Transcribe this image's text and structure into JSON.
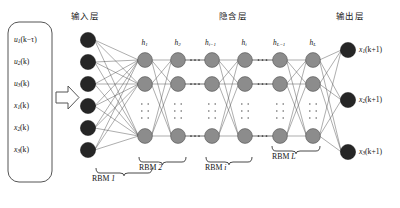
{
  "diagram": {
    "title_layers": {
      "input": "输入层",
      "hidden": "隐含层",
      "output": "输出层"
    },
    "input_box": {
      "labels": [
        {
          "base": "u",
          "sub": "1",
          "arg": "(k−τ)"
        },
        {
          "base": "u",
          "sub": "2",
          "arg": "(k)"
        },
        {
          "base": "u",
          "sub": "3",
          "arg": "(k)"
        },
        {
          "base": "x",
          "sub": "1",
          "arg": "(k)"
        },
        {
          "base": "x",
          "sub": "2",
          "arg": "(k)"
        },
        {
          "base": "x",
          "sub": "3",
          "arg": "(k)"
        }
      ]
    },
    "arrow": "flow-arrow-right",
    "input_nodes": {
      "count": 6,
      "color": "#262626"
    },
    "hidden_columns": [
      {
        "base": "h",
        "sub": "1"
      },
      {
        "base": "h",
        "sub": "2"
      },
      {
        "base": "h",
        "sub": "i−1"
      },
      {
        "base": "h",
        "sub": "i"
      },
      {
        "base": "h",
        "sub": "L−1"
      },
      {
        "base": "h",
        "sub": "L"
      }
    ],
    "hidden_nodes": {
      "rows_visible": 3,
      "color": "#8c8c8c",
      "vertical_ellipsis": true
    },
    "horizontal_ellipsis_between": [
      "h2-hi_minus_1",
      "hi-hL_minus_1"
    ],
    "output_nodes": {
      "count": 3,
      "color": "#262626"
    },
    "output_labels": [
      {
        "base": "x",
        "sub": "1",
        "arg": "(k+1)"
      },
      {
        "base": "x",
        "sub": "2",
        "arg": "(k+1)"
      },
      {
        "base": "x",
        "sub": "3",
        "arg": "(k+1)"
      }
    ],
    "rbm_braces": [
      {
        "text": "RBM ",
        "italic": "1"
      },
      {
        "text": "RBM ",
        "italic": "2"
      },
      {
        "text": "RBM ",
        "italic": "i"
      },
      {
        "text": "RBM ",
        "italic": "L"
      }
    ],
    "colors": {
      "node_dark": "#262626",
      "node_gray": "#8c8c8c",
      "edge": "#4a4a4a",
      "outline": "#555555",
      "text": "#111111",
      "background": "#ffffff"
    }
  }
}
